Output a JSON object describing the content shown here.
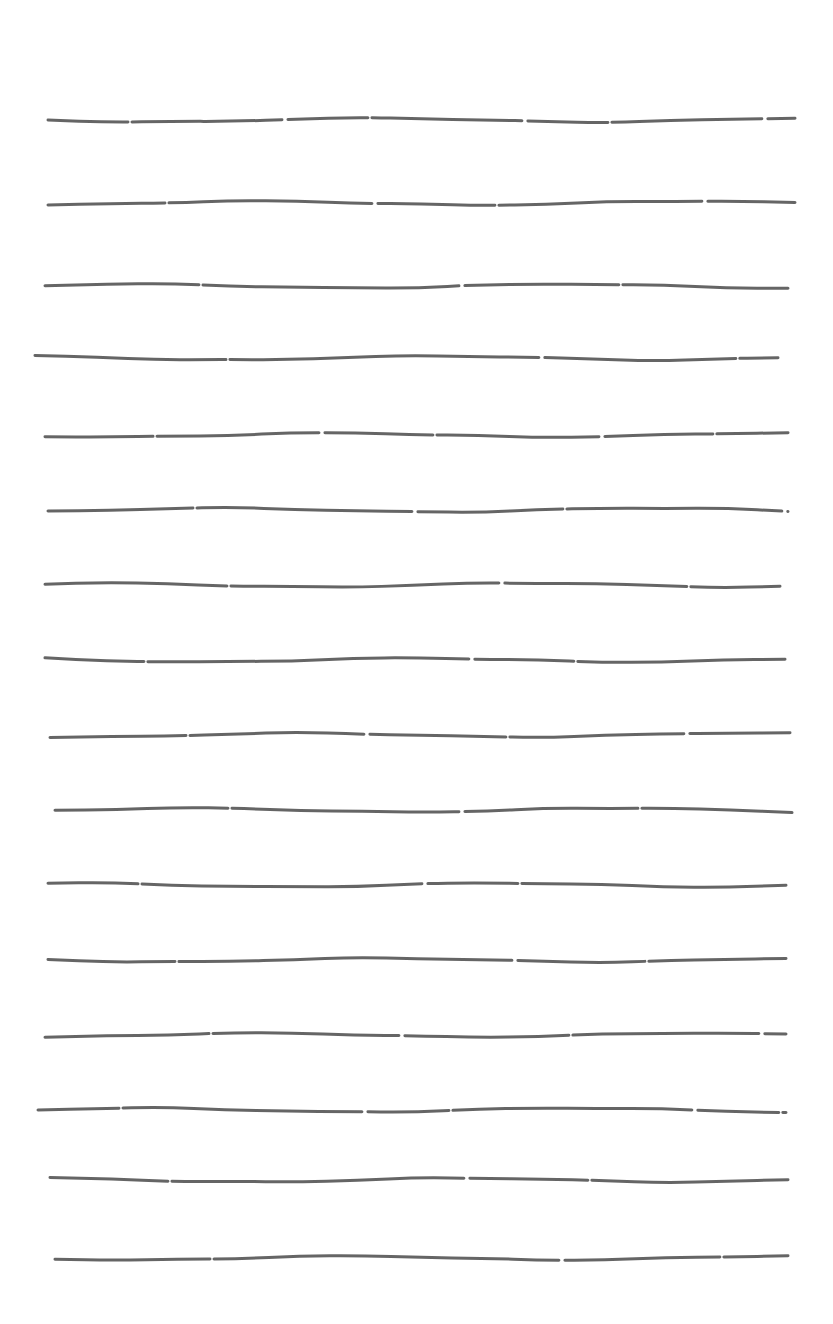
{
  "page": {
    "background": "#ffffff",
    "ink_color": "#4a4a4a"
  },
  "lines": [
    {
      "y": 120,
      "x1": 48,
      "x2": 795
    },
    {
      "y": 203,
      "x1": 48,
      "x2": 795
    },
    {
      "y": 286,
      "x1": 45,
      "x2": 788
    },
    {
      "y": 358,
      "x1": 35,
      "x2": 778
    },
    {
      "y": 435,
      "x1": 45,
      "x2": 788
    },
    {
      "y": 510,
      "x1": 48,
      "x2": 788
    },
    {
      "y": 585,
      "x1": 45,
      "x2": 780
    },
    {
      "y": 660,
      "x1": 45,
      "x2": 785
    },
    {
      "y": 735,
      "x1": 50,
      "x2": 790
    },
    {
      "y": 810,
      "x1": 55,
      "x2": 792
    },
    {
      "y": 885,
      "x1": 48,
      "x2": 786
    },
    {
      "y": 960,
      "x1": 48,
      "x2": 786
    },
    {
      "y": 1035,
      "x1": 45,
      "x2": 786
    },
    {
      "y": 1110,
      "x1": 38,
      "x2": 786
    },
    {
      "y": 1180,
      "x1": 50,
      "x2": 788
    },
    {
      "y": 1258,
      "x1": 55,
      "x2": 788
    }
  ]
}
